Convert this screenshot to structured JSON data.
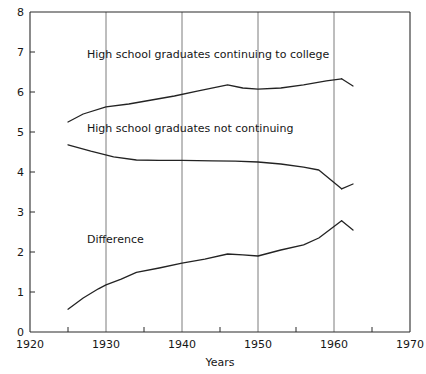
{
  "chart_data": {
    "type": "line",
    "title": "",
    "subtitle": "",
    "xlabel": "Years",
    "ylabel": "",
    "xlim": [
      1920,
      1970
    ],
    "ylim": [
      0,
      8
    ],
    "grid": "vertical",
    "legend_position": "inline-annotations",
    "x_ticks": [
      1920,
      1925,
      1930,
      1935,
      1940,
      1945,
      1950,
      1955,
      1960,
      1965,
      1970
    ],
    "x_tick_labels": [
      "1920",
      "",
      "1930",
      "",
      "1940",
      "",
      "1950",
      "",
      "1960",
      "",
      "1970"
    ],
    "x_gridlines": [
      1930,
      1940,
      1950,
      1960
    ],
    "y_ticks": [
      0,
      1,
      2,
      3,
      4,
      5,
      6,
      7,
      8
    ],
    "y_tick_labels": [
      "0",
      "1",
      "2",
      "3",
      "4",
      "5",
      "6",
      "7",
      "8"
    ],
    "series": [
      {
        "name": "High school graduates continuing to college",
        "label_x": 1927.5,
        "label_y": 6.85,
        "points": [
          [
            1925,
            5.25
          ],
          [
            1927,
            5.45
          ],
          [
            1930,
            5.63
          ],
          [
            1933,
            5.7
          ],
          [
            1936,
            5.8
          ],
          [
            1939,
            5.9
          ],
          [
            1942,
            6.02
          ],
          [
            1946,
            6.18
          ],
          [
            1948,
            6.1
          ],
          [
            1950,
            6.07
          ],
          [
            1953,
            6.1
          ],
          [
            1956,
            6.18
          ],
          [
            1959,
            6.28
          ],
          [
            1961,
            6.33
          ]
        ],
        "end_branch": [
          [
            1961,
            6.33
          ],
          [
            1962.5,
            6.15
          ]
        ]
      },
      {
        "name": "High school graduates not continuing",
        "label_x": 1927.5,
        "label_y": 5.0,
        "points": [
          [
            1925,
            4.68
          ],
          [
            1928,
            4.52
          ],
          [
            1931,
            4.38
          ],
          [
            1934,
            4.3
          ],
          [
            1937,
            4.29
          ],
          [
            1940,
            4.29
          ],
          [
            1944,
            4.28
          ],
          [
            1947,
            4.27
          ],
          [
            1950,
            4.25
          ],
          [
            1953,
            4.2
          ],
          [
            1956,
            4.12
          ],
          [
            1958,
            4.05
          ],
          [
            1961,
            3.58
          ]
        ],
        "end_branch": [
          [
            1961,
            3.58
          ],
          [
            1962.5,
            3.7
          ]
        ]
      },
      {
        "name": "Difference",
        "label_x": 1927.5,
        "label_y": 2.22,
        "points": [
          [
            1925,
            0.57
          ],
          [
            1927,
            0.85
          ],
          [
            1929,
            1.08
          ],
          [
            1930,
            1.18
          ],
          [
            1932,
            1.32
          ],
          [
            1934,
            1.49
          ],
          [
            1937,
            1.6
          ],
          [
            1940,
            1.72
          ],
          [
            1943,
            1.82
          ],
          [
            1946,
            1.95
          ],
          [
            1948,
            1.93
          ],
          [
            1950,
            1.9
          ],
          [
            1953,
            2.05
          ],
          [
            1956,
            2.18
          ],
          [
            1958,
            2.35
          ],
          [
            1961,
            2.78
          ]
        ],
        "end_branch": [
          [
            1961,
            2.78
          ],
          [
            1962.5,
            2.55
          ]
        ]
      }
    ]
  }
}
